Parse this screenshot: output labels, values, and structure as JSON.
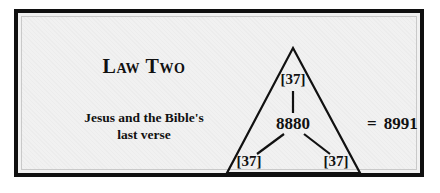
{
  "panel": {
    "heading": "Law Two",
    "caption_line1": "Jesus and the Bible's",
    "caption_line2": "last verse"
  },
  "diagram": {
    "type": "triangle-factor-diagram",
    "center_value": "8880",
    "top_value": "[37]",
    "bottom_left_value": "[37]",
    "bottom_right_value": "[37]",
    "equals_sign": "=",
    "result_value": "8991"
  },
  "colors": {
    "frame": "#101010",
    "inner_rule": "#c9c9c9",
    "background": "#f1f1f1",
    "ink": "#111111"
  }
}
